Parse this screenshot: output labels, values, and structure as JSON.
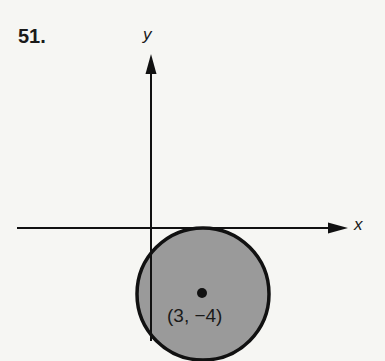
{
  "problem": {
    "number": "51."
  },
  "axes": {
    "x_label": "x",
    "y_label": "y"
  },
  "circle": {
    "center": [
      3,
      -4
    ],
    "radius": 4,
    "center_label": "(3, −4)",
    "fill_color": "#9a9a9a",
    "stroke_color": "#111111",
    "shaded": true
  },
  "colors": {
    "background": "#f6f6f3",
    "ink": "#111111"
  }
}
